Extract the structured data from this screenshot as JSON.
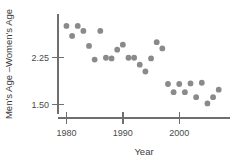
{
  "chart_data": {
    "type": "scatter",
    "title": "",
    "xlabel": "Year",
    "ylabel": "Men's Age –Women's Age",
    "xlim": [
      1978.5,
      2009.0
    ],
    "ylim": [
      1.35,
      2.95
    ],
    "grid": false,
    "legend": null,
    "xticks": [
      1980,
      1990,
      2000
    ],
    "xticklabels": [
      "1980",
      "1990",
      "2000"
    ],
    "yticks": [
      1.5,
      2.25
    ],
    "yticklabels": [
      "1.50",
      "2.25"
    ],
    "marker_color": "#8a8a8a",
    "axis_color": "#6f6f6f",
    "points": [
      {
        "x": 1980,
        "y": 2.76
      },
      {
        "x": 1981,
        "y": 2.6
      },
      {
        "x": 1982,
        "y": 2.76
      },
      {
        "x": 1983,
        "y": 2.68
      },
      {
        "x": 1984,
        "y": 2.44
      },
      {
        "x": 1985,
        "y": 2.22
      },
      {
        "x": 1986,
        "y": 2.68
      },
      {
        "x": 1987,
        "y": 2.25
      },
      {
        "x": 1988,
        "y": 2.24
      },
      {
        "x": 1989,
        "y": 2.38
      },
      {
        "x": 1990,
        "y": 2.46
      },
      {
        "x": 1991,
        "y": 2.25
      },
      {
        "x": 1992,
        "y": 2.25
      },
      {
        "x": 1993,
        "y": 2.14
      },
      {
        "x": 1994,
        "y": 2.03
      },
      {
        "x": 1995,
        "y": 2.24
      },
      {
        "x": 1996,
        "y": 2.5
      },
      {
        "x": 1997,
        "y": 2.4
      },
      {
        "x": 1998,
        "y": 1.83
      },
      {
        "x": 1999,
        "y": 1.7
      },
      {
        "x": 2000,
        "y": 1.83
      },
      {
        "x": 2001,
        "y": 1.7
      },
      {
        "x": 2002,
        "y": 1.84
      },
      {
        "x": 2003,
        "y": 1.62
      },
      {
        "x": 2004,
        "y": 1.85
      },
      {
        "x": 2005,
        "y": 1.52
      },
      {
        "x": 2006,
        "y": 1.62
      },
      {
        "x": 2007,
        "y": 1.74
      }
    ]
  }
}
